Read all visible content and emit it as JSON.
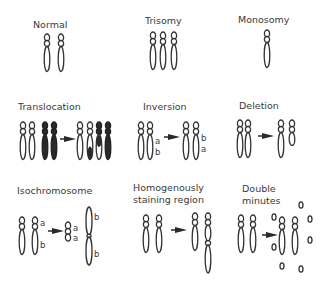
{
  "panels": [
    {
      "id": "normal",
      "title": "Normal"
    },
    {
      "id": "trisomy",
      "title": "Trisomy"
    },
    {
      "id": "monosomy",
      "title": "Monosomy"
    },
    {
      "id": "translocation",
      "title": "Translocation"
    },
    {
      "id": "inversion",
      "title": "Inversion",
      "before_labels": [
        "a",
        "b"
      ],
      "after_labels": [
        "b",
        "a"
      ]
    },
    {
      "id": "deletion",
      "title": "Deletion"
    },
    {
      "id": "isochromosome",
      "title": "Isochromosome",
      "before_labels": [
        "a",
        "b"
      ],
      "after_small_labels": [
        "a",
        "a"
      ],
      "after_large_labels": [
        "b",
        "b"
      ]
    },
    {
      "id": "hsr",
      "title_line1": "Homogenously",
      "title_line2": "staining region"
    },
    {
      "id": "double-minutes",
      "title_line1": "Double",
      "title_line2": "minutes"
    }
  ],
  "colors": {
    "stroke": "#333333",
    "dark_fill": "#2a2a2a",
    "text": "#3a3a3a",
    "background": "#ffffff"
  }
}
